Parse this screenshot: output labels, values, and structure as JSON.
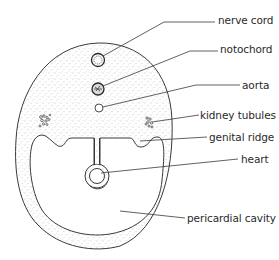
{
  "labels": [
    {
      "id": "nerve-cord",
      "text": "nerve cord",
      "x": 218,
      "y": 15
    },
    {
      "id": "notochord",
      "text": "notochord",
      "x": 220,
      "y": 44
    },
    {
      "id": "aorta",
      "text": "aorta",
      "x": 242,
      "y": 80
    },
    {
      "id": "kidney-tubules",
      "text": "kidney tubules",
      "x": 200,
      "y": 110
    },
    {
      "id": "genital-ridge",
      "text": "genital ridge",
      "x": 209,
      "y": 132
    },
    {
      "id": "heart",
      "text": "heart",
      "x": 241,
      "y": 154
    },
    {
      "id": "pericardial-cavity",
      "text": "pericardial cavity",
      "x": 187,
      "y": 213
    }
  ],
  "colors": {
    "outline": "#3a3a3a",
    "stipple": "#8a8a8a",
    "text": "#2a2a2a",
    "background": "#ffffff"
  }
}
